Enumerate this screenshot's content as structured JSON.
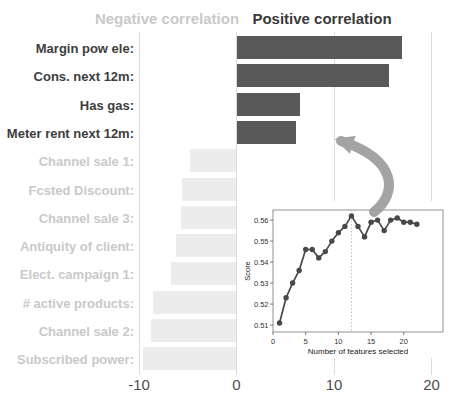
{
  "header": {
    "negative_title": "Negative correlation",
    "positive_title": "Positive correlation"
  },
  "colors": {
    "positive_bar": "#595959",
    "negative_bar": "#ececec",
    "positive_label": "#3d3d3d",
    "negative_label": "#c9c9c9",
    "grid": "#dcdcdc",
    "axis_tick_label": "#4d4d4d",
    "inset_line": "#484848",
    "inset_vline": "#b0b0b0",
    "arrow": "#9b9b9b"
  },
  "chart_data": [
    {
      "type": "bar",
      "orientation": "horizontal",
      "title_negative": "Negative correlation",
      "title_positive": "Positive correlation",
      "categories": [
        "Margin pow ele:",
        "Cons. next 12m:",
        "Has gas:",
        "Meter rent next 12m:",
        "Channel sale 1:",
        "Fcsted Discount:",
        "Channel sale 3:",
        "Antiquity of client:",
        "Elect. campaign 1:",
        "# active products:",
        "Channel sale 2:",
        "Subscribed power:"
      ],
      "values": [
        17.0,
        15.6,
        6.5,
        6.1,
        -4.8,
        -5.6,
        -5.7,
        -6.2,
        -6.7,
        -8.6,
        -8.8,
        -9.6
      ],
      "xticks": [
        -10,
        0,
        10,
        20
      ],
      "xlim": [
        -12.2,
        22
      ],
      "grid": "vertical-only"
    },
    {
      "type": "line",
      "xlabel": "Number of features selected",
      "ylabel": "Score",
      "x": [
        1,
        2,
        3,
        4,
        5,
        6,
        7,
        8,
        9,
        10,
        11,
        12,
        13,
        14,
        15,
        16,
        17,
        18,
        19,
        20,
        21,
        22
      ],
      "y": [
        0.511,
        0.523,
        0.53,
        0.536,
        0.546,
        0.546,
        0.542,
        0.545,
        0.55,
        0.554,
        0.557,
        0.562,
        0.557,
        0.552,
        0.559,
        0.56,
        0.555,
        0.56,
        0.561,
        0.559,
        0.559,
        0.558
      ],
      "xticks": [
        0,
        5,
        10,
        15,
        20
      ],
      "yticks": [
        0.51,
        0.52,
        0.53,
        0.54,
        0.55,
        0.56
      ],
      "xlim": [
        0,
        26
      ],
      "ylim": [
        0.5067,
        0.5648
      ],
      "vline_x": 12,
      "marker": "circle",
      "legend": "none"
    }
  ]
}
